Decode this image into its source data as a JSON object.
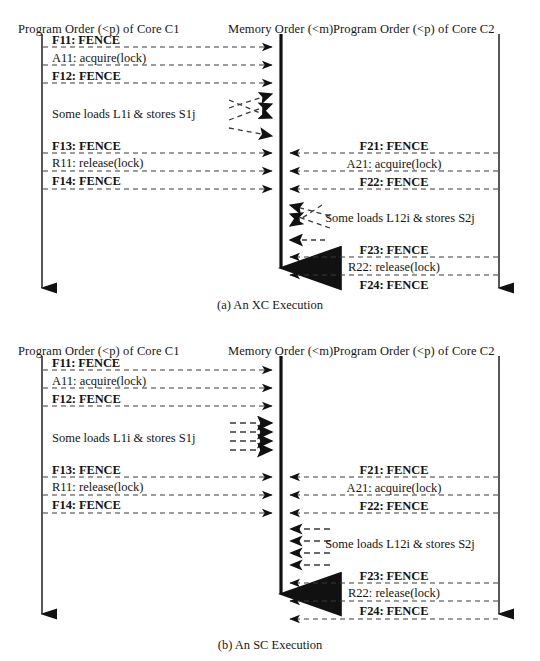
{
  "figures": [
    {
      "id": "a",
      "caption": "(a) An XC Execution",
      "headers": {
        "core1": "Program Order (<p) of Core C1",
        "memory": "Memory Order (<m)",
        "core2": "Program Order (<p) of Core C2"
      },
      "core1_events": [
        {
          "label": "F11: FENCE",
          "bold": true,
          "y": 40
        },
        {
          "label": "A11: acquire(lock)",
          "bold": false,
          "y": 58
        },
        {
          "label": "F12: FENCE",
          "bold": true,
          "y": 76
        },
        {
          "label": "Some loads L1i & stores S1j",
          "bold": false,
          "y": 114
        },
        {
          "label": "F13: FENCE",
          "bold": true,
          "y": 146
        },
        {
          "label": "R11: release(lock)",
          "bold": false,
          "y": 163
        },
        {
          "label": "F14: FENCE",
          "bold": true,
          "y": 181
        }
      ],
      "core2_events": [
        {
          "label": "F21: FENCE",
          "bold": true,
          "y": 146
        },
        {
          "label": "A21: acquire(lock)",
          "bold": false,
          "y": 164
        },
        {
          "label": "F22: FENCE",
          "bold": true,
          "y": 182
        },
        {
          "label": "Some loads L12i & stores S2j",
          "bold": false,
          "y": 218
        },
        {
          "label": "F23: FENCE",
          "bold": true,
          "y": 250
        },
        {
          "label": "R22: release(lock)",
          "bold": false,
          "y": 267
        },
        {
          "label": "F24: FENCE",
          "bold": true,
          "y": 285
        }
      ],
      "memory_order_style": "relaxed-crossing"
    },
    {
      "id": "b",
      "caption": "(b) An SC Execution",
      "headers": {
        "core1": "Program Order (<p) of Core C1",
        "memory": "Memory Order (<m)",
        "core2": "Program Order (<p) of Core C2"
      },
      "core1_events": [
        {
          "label": "F11: FENCE",
          "bold": true,
          "y": 41
        },
        {
          "label": "A11: acquire(lock)",
          "bold": false,
          "y": 59
        },
        {
          "label": "F12: FENCE",
          "bold": true,
          "y": 77
        },
        {
          "label": "Some loads L1i & stores S1j",
          "bold": false,
          "y": 116
        },
        {
          "label": "F13: FENCE",
          "bold": true,
          "y": 148
        },
        {
          "label": "R11: release(lock)",
          "bold": false,
          "y": 165
        },
        {
          "label": "F14: FENCE",
          "bold": true,
          "y": 183
        }
      ],
      "core2_events": [
        {
          "label": "F21: FENCE",
          "bold": true,
          "y": 148
        },
        {
          "label": "A21: acquire(lock)",
          "bold": false,
          "y": 166
        },
        {
          "label": "F22: FENCE",
          "bold": true,
          "y": 184
        },
        {
          "label": "Some loads L12i & stores S2j",
          "bold": false,
          "y": 222
        },
        {
          "label": "F23: FENCE",
          "bold": true,
          "y": 254
        },
        {
          "label": "R22: release(lock)",
          "bold": false,
          "y": 271
        },
        {
          "label": "F24: FENCE",
          "bold": true,
          "y": 289
        }
      ],
      "memory_order_style": "sequential-parallel"
    }
  ],
  "axes": {
    "core1_x": 42,
    "memory_x": 281,
    "core2_x": 499,
    "core1_label": "Program Order (<p) of Core C1",
    "memory_label": "Memory Order (<m)",
    "core2_label": "Program Order (<p) of Core C2"
  },
  "colors": {
    "ink": "#1a1a1a",
    "dashed": "#3a3a3a",
    "background": "#ffffff"
  }
}
